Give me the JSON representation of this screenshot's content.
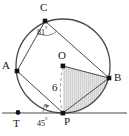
{
  "figure": {
    "type": "geometry-diagram",
    "background_color": "#ffffff",
    "stroke_color": "#3a3a3a",
    "shade_color": "#d9d9d9",
    "labels": {
      "center": "O",
      "point_a": "A",
      "point_b": "B",
      "point_c": "C",
      "point_p": "P",
      "point_t": "T",
      "radius_value": "6",
      "angle_at_c": "81",
      "angle_at_p": "45",
      "degree_symbol": "°"
    },
    "geometry": {
      "circle": {
        "cx": 63,
        "cy": 66,
        "r": 47
      },
      "points": {
        "O": {
          "x": 63,
          "y": 66
        },
        "P": {
          "x": 63,
          "y": 113
        },
        "B": {
          "x": 109,
          "y": 78
        },
        "A": {
          "x": 17,
          "y": 71
        },
        "C": {
          "x": 45,
          "y": 21
        },
        "T": {
          "x": 18,
          "y": 114
        }
      },
      "tangent_line": {
        "x1": 2,
        "y1": 113,
        "x2": 127,
        "y2": 113
      },
      "segments": [
        {
          "from": "C",
          "to": "A"
        },
        {
          "from": "C",
          "to": "B"
        },
        {
          "from": "A",
          "to": "P"
        },
        {
          "from": "O",
          "to": "B"
        },
        {
          "from": "P",
          "to": "B"
        }
      ],
      "dashed_segments": [
        {
          "from": "O",
          "to": "P"
        }
      ],
      "shaded_region": "triangle-O-B-P-with-segment"
    }
  }
}
